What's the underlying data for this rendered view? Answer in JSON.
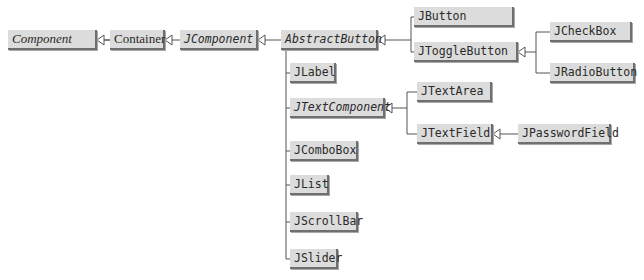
{
  "diagram": {
    "type": "class-hierarchy",
    "colors": {
      "box_fill": "#dcdcdc",
      "box_shadow": "#6f6f6f",
      "line": "#555555",
      "text": "#2a2a2a"
    },
    "nodes": {
      "component": {
        "label": "Component",
        "abstract": true
      },
      "container": {
        "label": "Container",
        "abstract": false
      },
      "jcomponent": {
        "label": "JComponent",
        "abstract": true
      },
      "abstractbutton": {
        "label": "AbstractButton",
        "abstract": true
      },
      "jbutton": {
        "label": "JButton",
        "abstract": false
      },
      "jtogglebutton": {
        "label": "JToggleButton",
        "abstract": false
      },
      "jcheckbox": {
        "label": "JCheckBox",
        "abstract": false
      },
      "jradiobutton": {
        "label": "JRadioButton",
        "abstract": false
      },
      "jlabel": {
        "label": "JLabel",
        "abstract": false
      },
      "jtextcomponent": {
        "label": "JTextComponent",
        "abstract": true
      },
      "jtextarea": {
        "label": "JTextArea",
        "abstract": false
      },
      "jtextfield": {
        "label": "JTextField",
        "abstract": false
      },
      "jpasswordfield": {
        "label": "JPasswordField",
        "abstract": false
      },
      "jcombobox": {
        "label": "JComboBox",
        "abstract": false
      },
      "jlist": {
        "label": "JList",
        "abstract": false
      },
      "jscrollbar": {
        "label": "JScrollBar",
        "abstract": false
      },
      "jslider": {
        "label": "JSlider",
        "abstract": false
      }
    },
    "edges": [
      {
        "from": "Container",
        "to": "Component",
        "kind": "inheritance"
      },
      {
        "from": "JComponent",
        "to": "Container",
        "kind": "inheritance"
      },
      {
        "from": "AbstractButton",
        "to": "JComponent",
        "kind": "inheritance"
      },
      {
        "from": "JLabel",
        "to": "JComponent",
        "kind": "inheritance"
      },
      {
        "from": "JTextComponent",
        "to": "JComponent",
        "kind": "inheritance"
      },
      {
        "from": "JComboBox",
        "to": "JComponent",
        "kind": "inheritance"
      },
      {
        "from": "JList",
        "to": "JComponent",
        "kind": "inheritance"
      },
      {
        "from": "JScrollBar",
        "to": "JComponent",
        "kind": "inheritance"
      },
      {
        "from": "JSlider",
        "to": "JComponent",
        "kind": "inheritance"
      },
      {
        "from": "JButton",
        "to": "AbstractButton",
        "kind": "inheritance"
      },
      {
        "from": "JToggleButton",
        "to": "AbstractButton",
        "kind": "inheritance"
      },
      {
        "from": "JCheckBox",
        "to": "JToggleButton",
        "kind": "inheritance"
      },
      {
        "from": "JRadioButton",
        "to": "JToggleButton",
        "kind": "inheritance"
      },
      {
        "from": "JTextArea",
        "to": "JTextComponent",
        "kind": "inheritance"
      },
      {
        "from": "JTextField",
        "to": "JTextComponent",
        "kind": "inheritance"
      },
      {
        "from": "JPasswordField",
        "to": "JTextField",
        "kind": "inheritance"
      }
    ]
  }
}
